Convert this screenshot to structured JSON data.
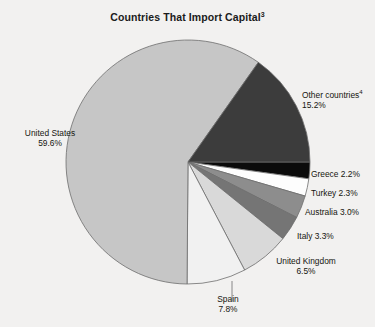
{
  "chart_data": {
    "type": "pie",
    "title": "Countries That Import Capital",
    "title_superscript": "3",
    "grid": false,
    "legend_position": "none",
    "labels_inline": true,
    "unit": "%",
    "categories": [
      "United States",
      "Other countries",
      "Greece",
      "Turkey",
      "Australia",
      "Italy",
      "United Kingdom",
      "Spain"
    ],
    "values": [
      59.6,
      15.2,
      2.2,
      2.3,
      3.0,
      3.3,
      6.5,
      7.8
    ],
    "colors": [
      "#c6c6c6",
      "#3c3c3c",
      "#0b0b0b",
      "#fdfdfd",
      "#8d8d8d",
      "#757575",
      "#d9d9d9",
      "#f1f1f1"
    ],
    "slices": [
      {
        "name": "United States",
        "value": 59.6,
        "value_text": "59.6%",
        "label": "United States",
        "superscript": "",
        "color": "#c6c6c6",
        "layout": "stacked"
      },
      {
        "name": "Other countries",
        "value": 15.2,
        "value_text": "15.2%",
        "label": "Other countries",
        "superscript": "4",
        "color": "#3c3c3c",
        "layout": "stacked"
      },
      {
        "name": "Greece",
        "value": 2.2,
        "value_text": "2.2%",
        "label": "Greece",
        "superscript": "",
        "color": "#0b0b0b",
        "layout": "inline"
      },
      {
        "name": "Turkey",
        "value": 2.3,
        "value_text": "2.3%",
        "label": "Turkey",
        "superscript": "",
        "color": "#fdfdfd",
        "layout": "inline"
      },
      {
        "name": "Australia",
        "value": 3.0,
        "value_text": "3.0%",
        "label": "Australia",
        "superscript": "",
        "color": "#8d8d8d",
        "layout": "inline"
      },
      {
        "name": "Italy",
        "value": 3.3,
        "value_text": "3.3%",
        "label": "Italy",
        "superscript": "",
        "color": "#757575",
        "layout": "inline"
      },
      {
        "name": "United Kingdom",
        "value": 6.5,
        "value_text": "6.5%",
        "label": "United Kingdom",
        "superscript": "",
        "color": "#d9d9d9",
        "layout": "stacked"
      },
      {
        "name": "Spain",
        "value": 7.8,
        "value_text": "7.8%",
        "label": "Spain",
        "superscript": "",
        "color": "#f1f1f1",
        "layout": "stacked"
      }
    ],
    "background_color": "#f2f1f0",
    "stroke_color": "#6d6d6d"
  },
  "labels": {
    "united_states": {
      "name": "United States",
      "value": "59.6%"
    },
    "other": {
      "name": "Other countries",
      "sup": "4",
      "value": "15.2%"
    },
    "greece": {
      "text": "Greece 2.2%"
    },
    "turkey": {
      "text": "Turkey 2.3%"
    },
    "australia": {
      "text": "Australia 3.0%"
    },
    "italy": {
      "text": "Italy 3.3%"
    },
    "uk": {
      "name": "United Kingdom",
      "value": "6.5%"
    },
    "spain": {
      "name": "Spain",
      "value": "7.8%"
    }
  },
  "title": {
    "main": "Countries That Import Capital",
    "sup": "3"
  }
}
